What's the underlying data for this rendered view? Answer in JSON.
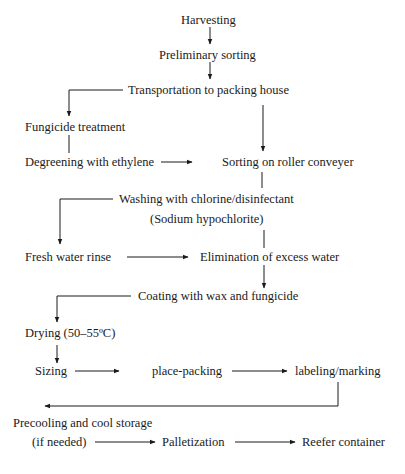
{
  "diagram": {
    "type": "flowchart",
    "title": "",
    "nodes": {
      "harvesting": "Harvesting",
      "preliminary_sorting": "Preliminary sorting",
      "transportation": "Transportation to packing house",
      "fungicide_treatment": "Fungicide treatment",
      "degreening": "Degreening with ethylene",
      "sorting_roller": "Sorting on roller conveyer",
      "washing": "Washing with chlorine/disinfectant",
      "washing_note": "(Sodium hypochlorite)",
      "fresh_water_rinse": "Fresh water rinse",
      "elimination_water": "Elimination of excess water",
      "coating": "Coating with wax and fungicide",
      "drying": "Drying (50–55ºC)",
      "sizing": "Sizing",
      "place_packing": "place-packing",
      "labeling": "labeling/marking",
      "precooling": "Precooling and cool storage",
      "precooling_note": "(if needed)",
      "palletization": "Palletization",
      "reefer": "Reefer container"
    },
    "edges": [
      [
        "Harvesting",
        "Preliminary sorting"
      ],
      [
        "Preliminary sorting",
        "Transportation to packing house"
      ],
      [
        "Transportation to packing house",
        "Fungicide treatment"
      ],
      [
        "Transportation to packing house",
        "Sorting on roller conveyer"
      ],
      [
        "Fungicide treatment",
        "Degreening with ethylene"
      ],
      [
        "Degreening with ethylene",
        "Sorting on roller conveyer"
      ],
      [
        "Sorting on roller conveyer",
        "Washing with chlorine/disinfectant"
      ],
      [
        "Washing with chlorine/disinfectant",
        "Fresh water rinse"
      ],
      [
        "Washing with chlorine/disinfectant",
        "Elimination of excess water"
      ],
      [
        "Fresh water rinse",
        "Elimination of excess water"
      ],
      [
        "Elimination of excess water",
        "Coating with wax and fungicide"
      ],
      [
        "Coating with wax and fungicide",
        "Drying (50–55ºC)"
      ],
      [
        "Drying (50–55ºC)",
        "Sizing"
      ],
      [
        "Sizing",
        "place-packing"
      ],
      [
        "place-packing",
        "labeling/marking"
      ],
      [
        "labeling/marking",
        "Precooling and cool storage"
      ],
      [
        "Precooling and cool storage",
        "Palletization"
      ],
      [
        "Palletization",
        "Reefer container"
      ]
    ]
  }
}
